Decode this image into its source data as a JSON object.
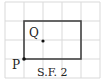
{
  "figure": {
    "caption": "S.F. 2",
    "grid": {
      "cell_size": 19,
      "origin_x": 5,
      "origin_y": 2,
      "columns": 5,
      "rows": 4,
      "line_color": "#d9d9d9"
    },
    "rectangle": {
      "x": 24,
      "y": 21,
      "width": 57,
      "height": 38,
      "stroke_color": "#444444"
    },
    "points": [
      {
        "label": "P",
        "x": 24,
        "y": 59
      },
      {
        "label": "Q",
        "x": 43,
        "y": 41
      }
    ]
  }
}
